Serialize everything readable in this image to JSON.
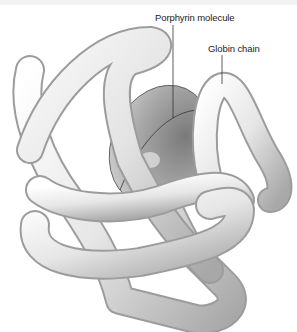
{
  "figure": {
    "labels": [
      {
        "id": "porphyrin",
        "text": "Porphyrin molecule"
      },
      {
        "id": "globin",
        "text": "Globin chain"
      }
    ],
    "colors": {
      "tube_light": "#ffffff",
      "tube_mid": "#dcdcdc",
      "tube_dark": "#9a9a9a",
      "disc_light": "#c8c8c8",
      "disc_dark": "#6e6e6e",
      "leader_line": "#333333"
    }
  }
}
